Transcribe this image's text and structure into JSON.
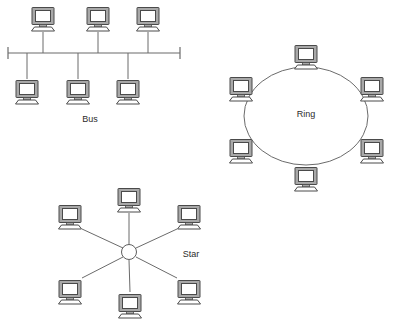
{
  "diagram": {
    "background_color": "#ffffff",
    "line_color": "#6b6b6b",
    "node_fill_color": "#a8a8a8",
    "node_screen_color": "#ffffff",
    "node_outline_color": "#4a4a4a",
    "label_color": "#2b2b2b"
  },
  "topologies": [
    {
      "id": "bus",
      "label": "Bus",
      "label_x": 90,
      "label_y": 120,
      "backbone": {
        "x1": 8,
        "y1": 53,
        "x2": 180,
        "y2": 53
      },
      "terminators": [
        {
          "x": 8,
          "y1": 47,
          "y2": 59
        },
        {
          "x": 180,
          "y1": 47,
          "y2": 59
        }
      ],
      "nodes": [
        {
          "id": "bus-pc-top-1",
          "x": 43,
          "y": 18,
          "drop_x": 43,
          "drop_y1": 32,
          "drop_y2": 53
        },
        {
          "id": "bus-pc-top-2",
          "x": 98,
          "y": 18,
          "drop_x": 98,
          "drop_y1": 32,
          "drop_y2": 53
        },
        {
          "id": "bus-pc-top-3",
          "x": 148,
          "y": 18,
          "drop_x": 148,
          "drop_y1": 32,
          "drop_y2": 53
        },
        {
          "id": "bus-pc-bottom-1",
          "x": 27,
          "y": 91,
          "drop_x": 27,
          "drop_y1": 53,
          "drop_y2": 78
        },
        {
          "id": "bus-pc-bottom-2",
          "x": 78,
          "y": 91,
          "drop_x": 78,
          "drop_y1": 53,
          "drop_y2": 78
        },
        {
          "id": "bus-pc-bottom-3",
          "x": 128,
          "y": 91,
          "drop_x": 128,
          "drop_y1": 53,
          "drop_y2": 78
        }
      ]
    },
    {
      "id": "ring",
      "label": "Ring",
      "label_x": 306,
      "label_y": 115,
      "ellipse": {
        "cx": 306,
        "cy": 116,
        "rx": 62,
        "ry": 49
      },
      "nodes": [
        {
          "id": "ring-pc-top",
          "x": 306,
          "y": 56
        },
        {
          "id": "ring-pc-upper-left",
          "x": 241,
          "y": 88
        },
        {
          "id": "ring-pc-upper-right",
          "x": 372,
          "y": 88
        },
        {
          "id": "ring-pc-lower-left",
          "x": 241,
          "y": 150
        },
        {
          "id": "ring-pc-lower-right",
          "x": 372,
          "y": 150
        },
        {
          "id": "ring-pc-bottom",
          "x": 306,
          "y": 178
        }
      ]
    },
    {
      "id": "star",
      "label": "Star",
      "label_x": 191,
      "label_y": 255,
      "hub": {
        "cx": 129,
        "cy": 252,
        "r": 7.5
      },
      "nodes": [
        {
          "id": "star-pc-top",
          "x": 129,
          "y": 199,
          "spoke_x": 129,
          "spoke_y": 213
        },
        {
          "id": "star-pc-upper-left",
          "x": 70,
          "y": 216,
          "spoke_x": 82,
          "spoke_y": 229
        },
        {
          "id": "star-pc-upper-right",
          "x": 189,
          "y": 216,
          "spoke_x": 177,
          "spoke_y": 229
        },
        {
          "id": "star-pc-lower-left",
          "x": 70,
          "y": 291,
          "spoke_x": 82,
          "spoke_y": 278
        },
        {
          "id": "star-pc-lower-right",
          "x": 189,
          "y": 291,
          "spoke_x": 177,
          "spoke_y": 278
        },
        {
          "id": "star-pc-bottom",
          "x": 130,
          "y": 305,
          "spoke_x": 130,
          "spoke_y": 292
        }
      ]
    }
  ]
}
